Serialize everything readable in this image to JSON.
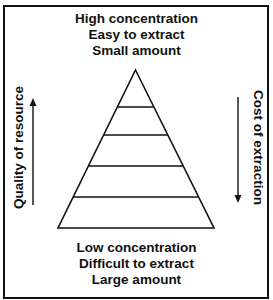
{
  "diagram": {
    "type": "resource pyramid",
    "top_labels": [
      "High concentration",
      "Easy to extract",
      "Small amount"
    ],
    "bottom_labels": [
      "Low concentration",
      "Difficult to extract",
      "Large amount"
    ],
    "left_axis": {
      "label": "Quality of resource",
      "arrow_direction": "up"
    },
    "right_axis": {
      "label": "Cost of extraction",
      "arrow_direction": "down"
    },
    "pyramid_levels": 5,
    "colors": {
      "stroke": "#111111",
      "background": "#ffffff"
    }
  }
}
